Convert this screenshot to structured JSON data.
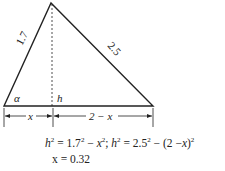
{
  "diagram": {
    "type": "triangle",
    "sides": {
      "left": "1.7",
      "right": "2.5"
    },
    "angle_label": "α",
    "height_label": "h",
    "base_segments": {
      "left": "x",
      "right": "2 − x"
    },
    "colors": {
      "stroke": "#222222",
      "background": "#ffffff"
    }
  },
  "equations": {
    "line1": "h² = 1.7² − x²; h² = 2.5² − (2 − x)²",
    "line2": "x = 0.32"
  }
}
